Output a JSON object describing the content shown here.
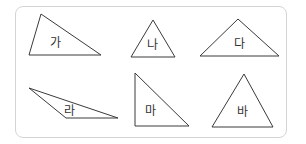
{
  "figure": {
    "frame_border_color": "#d4d4d4",
    "stroke_color": "#3a3a3a",
    "triangles": [
      {
        "label": "가",
        "points": "41,14 29,55 101,55",
        "label_x": 50,
        "label_y": 47
      },
      {
        "label": "나",
        "points": "153,20 131,57 175,57",
        "label_x": 147,
        "label_y": 49
      },
      {
        "label": "다",
        "points": "238,19 200,56 279,56",
        "label_x": 234,
        "label_y": 48
      },
      {
        "label": "라",
        "points": "29,88 66,118 118,118",
        "label_x": 64,
        "label_y": 115
      },
      {
        "label": "마",
        "points": "135,73 135,126 189,126",
        "label_x": 145,
        "label_y": 115
      },
      {
        "label": "바",
        "points": "244,74 212,127 273,127",
        "label_x": 237,
        "label_y": 116
      }
    ]
  }
}
